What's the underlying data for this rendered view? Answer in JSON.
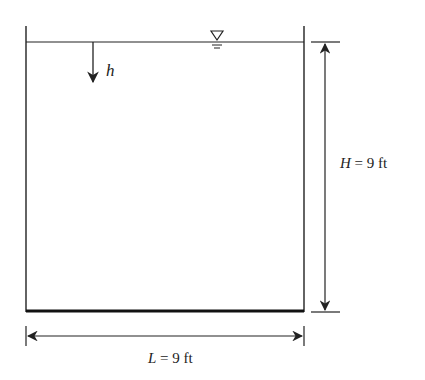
{
  "diagram": {
    "type": "tank-cross-section",
    "water_surface_symbol": "free-surface-triangle",
    "depth_variable": {
      "symbol": "h",
      "direction": "downward"
    },
    "height_dimension": {
      "label_var": "H",
      "label_eq": " = 9 ft"
    },
    "length_dimension": {
      "label_var": "L",
      "label_eq": " = 9 ft"
    },
    "colors": {
      "stroke": "#222222",
      "background": "#ffffff"
    }
  }
}
